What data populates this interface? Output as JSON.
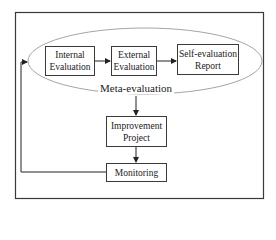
{
  "diagram": {
    "nodes": {
      "internal": {
        "line1": "Internal",
        "line2": "Evaluation"
      },
      "external": {
        "line1": "External",
        "line2": "Evaluation"
      },
      "self_report": {
        "line1": "Self-evaluation",
        "line2": "Report"
      },
      "improvement": {
        "line1": "Improvement",
        "line2": "Project"
      },
      "monitoring": {
        "line1": "Monitoring"
      }
    },
    "group_label": "Meta-evaluation",
    "edges": [
      {
        "from": "Internal Evaluation",
        "to": "External Evaluation"
      },
      {
        "from": "External Evaluation",
        "to": "Self-evaluation Report"
      },
      {
        "from": "Meta-evaluation",
        "to": "Improvement Project"
      },
      {
        "from": "Improvement Project",
        "to": "Monitoring"
      },
      {
        "from": "Monitoring",
        "to": "Meta-evaluation"
      }
    ],
    "colors": {
      "stroke": "#3a3a3a",
      "ellipse": "#9a9a9a",
      "background": "#ffffff"
    }
  }
}
